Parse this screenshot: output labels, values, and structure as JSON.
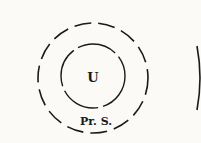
{
  "diagram": {
    "inner_label": "U",
    "outer_label": "Pr. S.",
    "colors": {
      "stroke": "#1a1a1a",
      "background": "#fbfaf7"
    }
  }
}
